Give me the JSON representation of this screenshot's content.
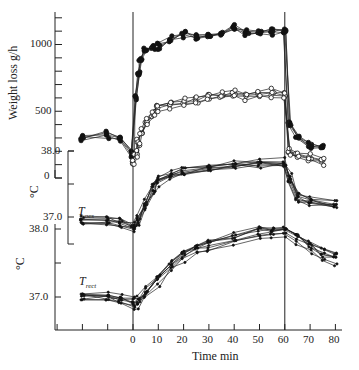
{
  "chart_data": [
    {
      "panel": "weight_loss",
      "type": "line",
      "ylabel": "Weight loss  g/h",
      "xlabel": "Time min",
      "ylim": [
        0,
        1250
      ],
      "yticks": [
        {
          "value": 1000,
          "label": "1000"
        },
        {
          "value": 500,
          "label": "500"
        },
        {
          "value": 0,
          "label": "0"
        }
      ],
      "xticks": [
        0,
        10,
        20,
        30,
        40,
        50,
        60,
        70,
        80
      ],
      "x": [
        -20,
        -10,
        -5,
        0,
        1,
        2,
        3,
        5,
        8,
        10,
        15,
        20,
        25,
        30,
        35,
        40,
        45,
        50,
        55,
        60,
        62,
        65,
        70,
        75
      ],
      "series": [
        {
          "name": "filled circles (exercise group, high)",
          "marker": "filled",
          "values": [
            300,
            320,
            280,
            190,
            600,
            780,
            880,
            960,
            980,
            990,
            1040,
            1080,
            1060,
            1070,
            1090,
            1120,
            1080,
            1090,
            1100,
            1100,
            400,
            300,
            250,
            240
          ]
        },
        {
          "name": "open circles (low)",
          "marker": "open",
          "values": [
            null,
            null,
            null,
            100,
            180,
            260,
            340,
            420,
            480,
            520,
            540,
            560,
            580,
            600,
            610,
            620,
            610,
            620,
            630,
            620,
            180,
            160,
            140,
            120
          ]
        }
      ]
    },
    {
      "panel": "T_oes",
      "type": "line",
      "label": "T_oes",
      "ylabel": "°C",
      "yticks": [
        {
          "value": 38.0,
          "label": "38.0"
        },
        {
          "value": 37.0,
          "label": "37.0"
        }
      ],
      "x": [
        -20,
        -10,
        -5,
        0,
        2,
        5,
        8,
        10,
        15,
        20,
        30,
        40,
        50,
        60,
        62,
        65,
        70,
        80
      ],
      "values_mean": [
        36.95,
        36.95,
        36.92,
        36.85,
        36.95,
        37.2,
        37.45,
        37.55,
        37.65,
        37.7,
        37.76,
        37.8,
        37.82,
        37.83,
        37.6,
        37.3,
        37.25,
        37.2
      ]
    },
    {
      "panel": "T_rect",
      "type": "line",
      "label": "T_rect",
      "ylabel": "°C",
      "yticks": [
        {
          "value": 38.0,
          "label": "38.0"
        },
        {
          "value": 37.0,
          "label": "37.0"
        }
      ],
      "x": [
        -20,
        -10,
        -5,
        0,
        2,
        5,
        10,
        15,
        20,
        25,
        30,
        40,
        50,
        55,
        60,
        65,
        70,
        75,
        80
      ],
      "values_mean": [
        37.0,
        36.98,
        36.95,
        36.9,
        36.92,
        37.05,
        37.25,
        37.45,
        37.6,
        37.68,
        37.75,
        37.85,
        37.93,
        37.95,
        37.96,
        37.85,
        37.72,
        37.62,
        37.55
      ]
    }
  ],
  "labels": {
    "weight_ylabel": "Weight loss  g/h",
    "tick_1000": "1000",
    "tick_500": "500",
    "tick_zero": "0",
    "oes_top": "38.0",
    "oes_bottom": "37.0",
    "oes_unit": "°C",
    "oes_name": "T",
    "oes_sub": "oes",
    "rect_top": "38.0",
    "rect_bottom": "37.0",
    "rect_unit": "°C",
    "rect_name": "T",
    "rect_sub": "rect",
    "xlabel": "Time min",
    "xticks": [
      "0",
      "10",
      "20",
      "30",
      "40",
      "50",
      "60",
      "70",
      "80"
    ]
  }
}
